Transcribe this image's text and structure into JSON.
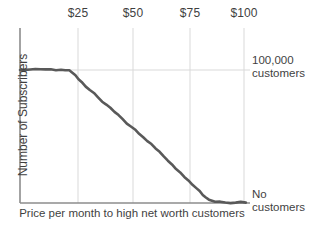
{
  "chart_data": {
    "type": "line",
    "title": "",
    "xlabel": "Price per month to high net worth customers",
    "ylabel": "Number of Subscribers",
    "xlim": [
      0,
      112
    ],
    "ylim": [
      0,
      118000
    ],
    "grid": true,
    "legend": null,
    "x_ticks": [
      {
        "value": 25,
        "label": "$25"
      },
      {
        "value": 50,
        "label": "$50"
      },
      {
        "value": 75,
        "label": "$75"
      },
      {
        "value": 100,
        "label": "$100"
      }
    ],
    "y_ticks": [
      {
        "value": 100000,
        "label": "100,000 customers"
      },
      {
        "value": 0,
        "label": "No customers"
      }
    ],
    "annotations": [
      {
        "text_line1": "100,000",
        "text_line2": "customers",
        "at_y": 100000
      },
      {
        "text_line1": "No",
        "text_line2": "customers",
        "at_y": 0
      }
    ],
    "series": [
      {
        "name": "Subscribers vs price",
        "color": "#595959",
        "x": [
          0,
          5,
          10,
          15,
          20,
          24,
          27,
          30,
          34,
          38,
          42,
          46,
          50,
          54,
          58,
          62,
          66,
          70,
          74,
          78,
          82,
          86,
          89,
          92,
          95,
          100,
          105,
          110
        ],
        "values": [
          100000,
          100400,
          100600,
          100500,
          100200,
          99800,
          96000,
          91000,
          85000,
          79500,
          74000,
          68500,
          63000,
          57500,
          52000,
          46500,
          41000,
          35000,
          29000,
          23000,
          17000,
          11000,
          6000,
          2500,
          900,
          400,
          300,
          300
        ]
      }
    ]
  },
  "axis": {
    "x_tick_labels": [
      "$25",
      "$50",
      "$75",
      "$100"
    ],
    "y_axis_title": "Number of Subscribers",
    "x_axis_title": "Price per month to high net worth customers"
  },
  "notes": {
    "top_right_line1": "100,000",
    "top_right_line2": "customers",
    "bottom_right_line1": "No",
    "bottom_right_line2": "customers"
  },
  "colors": {
    "line": "#595959",
    "axis": "#8c8c8c",
    "grid": "#d9d9d9",
    "text": "#3f3f3f",
    "background": "#ffffff"
  }
}
